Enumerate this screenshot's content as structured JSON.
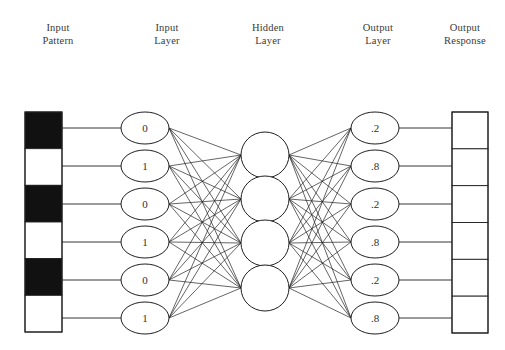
{
  "figure": {
    "headers": [
      {
        "id": "input-pattern",
        "text": "Input\nPattern",
        "cx": 58,
        "top": 22
      },
      {
        "id": "input-layer",
        "text": "Input\nLayer",
        "cx": 167,
        "top": 22
      },
      {
        "id": "hidden-layer",
        "text": "Hidden\nLayer",
        "cx": 268,
        "top": 22
      },
      {
        "id": "output-layer",
        "text": "Output\nLayer",
        "cx": 378,
        "top": 22
      },
      {
        "id": "output-response",
        "text": "Output\nResponse",
        "cx": 465,
        "top": 22
      }
    ],
    "colors": {
      "stroke": "#1f1f1f",
      "edge": "#222222",
      "fill_black": "#111111",
      "fill_white": "#ffffff",
      "text": "#2f2f2f",
      "background": "#ffffff"
    }
  },
  "input_pattern": {
    "name": "input-pattern-strip",
    "x": 25,
    "y": 112,
    "width": 37,
    "height": 220,
    "cells": [
      {
        "index": 0,
        "state": "black",
        "value": 1
      },
      {
        "index": 1,
        "state": "white",
        "value": 0
      },
      {
        "index": 2,
        "state": "black",
        "value": 1
      },
      {
        "index": 3,
        "state": "white",
        "value": 0
      },
      {
        "index": 4,
        "state": "black",
        "value": 1
      },
      {
        "index": 5,
        "state": "white",
        "value": 0
      }
    ]
  },
  "output_response": {
    "name": "output-response-strip",
    "x": 452,
    "y": 112,
    "width": 36,
    "height": 221,
    "cells": [
      {
        "index": 0,
        "state": "white"
      },
      {
        "index": 1,
        "state": "white"
      },
      {
        "index": 2,
        "state": "white"
      },
      {
        "index": 3,
        "state": "white"
      },
      {
        "index": 4,
        "state": "white"
      },
      {
        "index": 5,
        "state": "white"
      }
    ]
  },
  "layers": {
    "input": {
      "name": "input-layer",
      "cx": 145,
      "rx": 24,
      "ry": 16,
      "nodes": [
        {
          "index": 0,
          "label": "0",
          "cy": 128
        },
        {
          "index": 1,
          "label": "1",
          "cy": 166
        },
        {
          "index": 2,
          "label": "0",
          "cy": 204
        },
        {
          "index": 3,
          "label": "1",
          "cy": 242
        },
        {
          "index": 4,
          "label": "0",
          "cy": 280
        },
        {
          "index": 5,
          "label": "1",
          "cy": 318
        }
      ]
    },
    "hidden": {
      "name": "hidden-layer",
      "cx": 265,
      "rx": 24,
      "ry": 23,
      "nodes": [
        {
          "index": 0,
          "label": "",
          "cy": 155
        },
        {
          "index": 1,
          "label": "",
          "cy": 199
        },
        {
          "index": 2,
          "label": "",
          "cy": 243
        },
        {
          "index": 3,
          "label": "",
          "cy": 288
        }
      ]
    },
    "output": {
      "name": "output-layer",
      "cx": 375,
      "rx": 24,
      "ry": 16,
      "nodes": [
        {
          "index": 0,
          "label": ".2",
          "cy": 128
        },
        {
          "index": 1,
          "label": ".8",
          "cy": 166
        },
        {
          "index": 2,
          "label": ".2",
          "cy": 204
        },
        {
          "index": 3,
          "label": ".8",
          "cy": 242
        },
        {
          "index": 4,
          "label": ".2",
          "cy": 280
        },
        {
          "index": 5,
          "label": ".8",
          "cy": 318
        }
      ]
    }
  },
  "connections": {
    "pattern_to_input": {
      "name": "pattern-feed-lines",
      "from_x": 62,
      "to_x": 121
    },
    "input_to_hidden": {
      "name": "input-hidden-edges",
      "fully_connected": true,
      "count": 24
    },
    "hidden_to_output": {
      "name": "hidden-output-edges",
      "fully_connected": true,
      "count": 24
    },
    "output_to_response": {
      "name": "response-feed-lines",
      "from_x": 399,
      "to_x": 452
    }
  }
}
